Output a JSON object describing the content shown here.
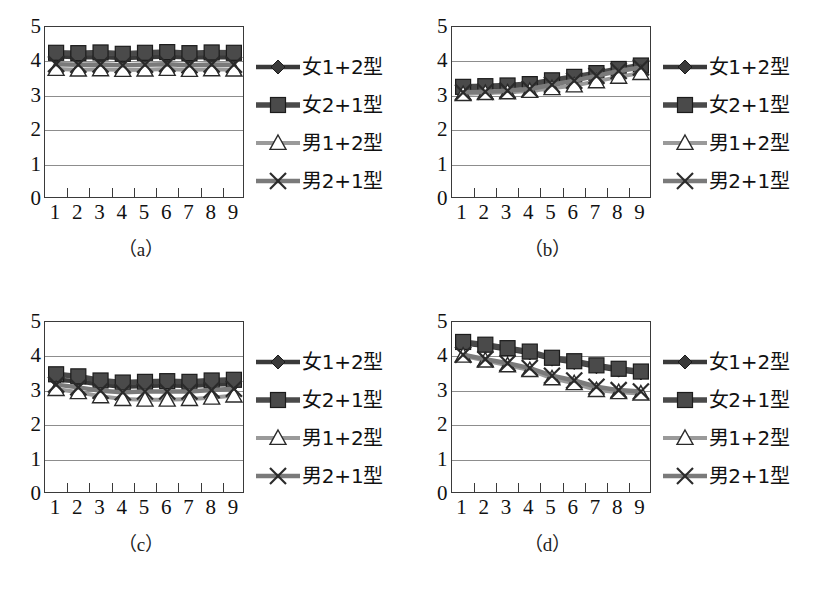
{
  "figure": {
    "series_names": [
      "女1+2型",
      "女2+1型",
      "男1+2型",
      "男2+1型"
    ],
    "categories": [
      "1",
      "2",
      "3",
      "4",
      "5",
      "6",
      "7",
      "8",
      "9"
    ],
    "y_ticks": [
      "0",
      "1",
      "2",
      "3",
      "4",
      "5"
    ],
    "colors": {
      "series1": "#3a3a3a",
      "series2": "#4a4a4a",
      "series3": "#9a9a9a",
      "series4": "#7a7a7a",
      "gridline": "#8d8d8d",
      "axis": "#3a3a3a",
      "background": "#ffffff"
    }
  },
  "chart_data": [
    {
      "type": "line",
      "panel": "a",
      "caption": "（a）",
      "title": "",
      "xlabel": "",
      "ylabel": "",
      "categories": [
        "1",
        "2",
        "3",
        "4",
        "5",
        "6",
        "7",
        "8",
        "9"
      ],
      "ylim": [
        0,
        5
      ],
      "yticks": [
        0,
        1,
        2,
        3,
        4,
        5
      ],
      "grid": true,
      "legend_position": "right",
      "series": [
        {
          "name": "女1+2型",
          "values": [
            4.15,
            4.12,
            4.13,
            4.1,
            4.12,
            4.14,
            4.11,
            4.13,
            4.12
          ]
        },
        {
          "name": "女2+1型",
          "values": [
            4.25,
            4.24,
            4.26,
            4.22,
            4.25,
            4.27,
            4.24,
            4.26,
            4.25
          ]
        },
        {
          "name": "男1+2型",
          "values": [
            3.78,
            3.76,
            3.77,
            3.75,
            3.76,
            3.78,
            3.75,
            3.77,
            3.76
          ]
        },
        {
          "name": "男2+1型",
          "values": [
            3.92,
            3.9,
            3.91,
            3.89,
            3.9,
            3.92,
            3.89,
            3.91,
            3.9
          ]
        }
      ]
    },
    {
      "type": "line",
      "panel": "b",
      "caption": "（b）",
      "title": "",
      "xlabel": "",
      "ylabel": "",
      "categories": [
        "1",
        "2",
        "3",
        "4",
        "5",
        "6",
        "7",
        "8",
        "9"
      ],
      "ylim": [
        0,
        5
      ],
      "yticks": [
        0,
        1,
        2,
        3,
        4,
        5
      ],
      "grid": true,
      "legend_position": "right",
      "series": [
        {
          "name": "女1+2型",
          "values": [
            3.22,
            3.24,
            3.28,
            3.32,
            3.42,
            3.52,
            3.62,
            3.74,
            3.84
          ]
        },
        {
          "name": "女2+1型",
          "values": [
            3.26,
            3.28,
            3.3,
            3.34,
            3.45,
            3.55,
            3.66,
            3.78,
            3.88
          ]
        },
        {
          "name": "男1+2型",
          "values": [
            3.05,
            3.08,
            3.1,
            3.14,
            3.22,
            3.3,
            3.42,
            3.55,
            3.66
          ]
        },
        {
          "name": "男2+1型",
          "values": [
            3.1,
            3.12,
            3.15,
            3.2,
            3.32,
            3.44,
            3.58,
            3.72,
            3.82
          ]
        }
      ]
    },
    {
      "type": "line",
      "panel": "c",
      "caption": "（c）",
      "title": "",
      "xlabel": "",
      "ylabel": "",
      "categories": [
        "1",
        "2",
        "3",
        "4",
        "5",
        "6",
        "7",
        "8",
        "9"
      ],
      "ylim": [
        0,
        5
      ],
      "yticks": [
        0,
        1,
        2,
        3,
        4,
        5
      ],
      "grid": true,
      "legend_position": "right",
      "series": [
        {
          "name": "女1+2型",
          "values": [
            3.32,
            3.28,
            3.18,
            3.12,
            3.14,
            3.16,
            3.14,
            3.18,
            3.2
          ]
        },
        {
          "name": "女2+1型",
          "values": [
            3.48,
            3.42,
            3.3,
            3.24,
            3.26,
            3.28,
            3.26,
            3.3,
            3.32
          ]
        },
        {
          "name": "男1+2型",
          "values": [
            3.05,
            2.96,
            2.84,
            2.76,
            2.74,
            2.74,
            2.76,
            2.8,
            2.86
          ]
        },
        {
          "name": "男2+1型",
          "values": [
            3.18,
            3.1,
            3.0,
            2.96,
            2.98,
            2.98,
            2.98,
            3.02,
            3.06
          ]
        }
      ]
    },
    {
      "type": "line",
      "panel": "d",
      "caption": "（d）",
      "title": "",
      "xlabel": "",
      "ylabel": "",
      "categories": [
        "1",
        "2",
        "3",
        "4",
        "5",
        "6",
        "7",
        "8",
        "9"
      ],
      "ylim": [
        0,
        5
      ],
      "yticks": [
        0,
        1,
        2,
        3,
        4,
        5
      ],
      "grid": true,
      "legend_position": "right",
      "series": [
        {
          "name": "女1+2型",
          "values": [
            4.38,
            4.3,
            4.2,
            4.1,
            3.92,
            3.82,
            3.7,
            3.6,
            3.52
          ]
        },
        {
          "name": "女2+1型",
          "values": [
            4.42,
            4.34,
            4.24,
            4.14,
            3.96,
            3.86,
            3.74,
            3.64,
            3.56
          ]
        },
        {
          "name": "男1+2型",
          "values": [
            4.02,
            3.88,
            3.74,
            3.6,
            3.36,
            3.22,
            3.02,
            2.96,
            2.92
          ]
        },
        {
          "name": "男2+1型",
          "values": [
            4.05,
            3.92,
            3.8,
            3.66,
            3.44,
            3.3,
            3.12,
            3.02,
            2.98
          ]
        }
      ]
    }
  ]
}
